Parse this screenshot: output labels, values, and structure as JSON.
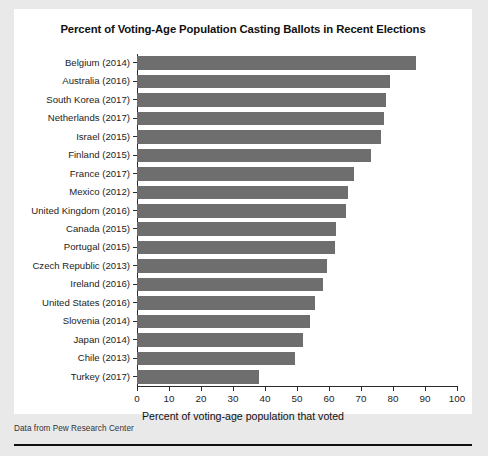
{
  "figure": {
    "title": "Percent of Voting-Age Population Casting Ballots in Recent Elections",
    "source_note": "Data from Pew Research Center",
    "bar_color": "#6e6e6e",
    "card_background": "#ffffff",
    "page_background": "#e9e9e9"
  },
  "chart_data": {
    "type": "bar",
    "orientation": "horizontal",
    "title": "Percent of Voting-Age Population Casting Ballots in Recent Elections",
    "xlabel": "Percent of voting-age population that voted",
    "ylabel": "",
    "xlim": [
      0,
      100
    ],
    "xticks": [
      0,
      10,
      20,
      30,
      40,
      50,
      60,
      70,
      80,
      90,
      100
    ],
    "xticklabels": [
      "0",
      "10",
      "20",
      "30",
      "40",
      "50",
      "60",
      "70",
      "80",
      "90",
      "100"
    ],
    "grid": false,
    "legend": false,
    "categories": [
      "Belgium (2014)",
      "Australia (2016)",
      "South Korea (2017)",
      "Netherlands (2017)",
      "Israel (2015)",
      "Finland (2015)",
      "France (2017)",
      "Mexico (2012)",
      "United Kingdom (2016)",
      "Canada (2015)",
      "Portugal (2015)",
      "Czech Republic (2013)",
      "Ireland (2016)",
      "United States (2016)",
      "Slovenia (2014)",
      "Japan (2014)",
      "Chile (2013)",
      "Turkey (2017)"
    ],
    "values": [
      87.2,
      79,
      77.9,
      77.3,
      76.1,
      73.1,
      67.9,
      66,
      65.4,
      62.1,
      61.8,
      59.4,
      58,
      55.7,
      54.1,
      52,
      49.3,
      38.2
    ]
  }
}
